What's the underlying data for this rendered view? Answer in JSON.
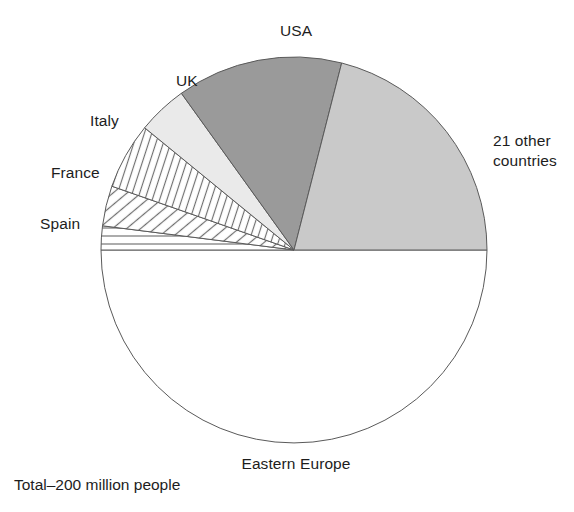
{
  "figure": {
    "caption": "Total–200 million people",
    "background": "#ffffff",
    "text_color": "#1d1d1d"
  },
  "chart_data": {
    "type": "pie",
    "title": "",
    "total_label": "Total–200 million people",
    "total_value": 200,
    "units": "million people",
    "legend": "none (direct slice labels)",
    "start_angle_deg": 180,
    "direction": "clockwise",
    "categories": [
      "Eastern Europe",
      "Spain",
      "France",
      "Italy",
      "UK",
      "USA",
      "21 other countries"
    ],
    "values": [
      100,
      4,
      6.7,
      11.1,
      8.3,
      27.8,
      42.1
    ],
    "percents": [
      50,
      2,
      3.35,
      5.55,
      4.15,
      13.9,
      21.05
    ],
    "angles_deg": [
      180,
      7.2,
      12.1,
      20.0,
      15.0,
      50.0,
      75.7
    ],
    "slices": [
      {
        "label": "Eastern Europe",
        "value": 100,
        "percent": 50,
        "angle_deg": 180,
        "fill": "#ffffff",
        "pattern": "solid",
        "label_position": "below"
      },
      {
        "label": "Spain",
        "value": 4,
        "percent": 2,
        "angle_deg": 7.2,
        "fill": "#ffffff",
        "pattern": "horizontal-lines",
        "label_position": "left"
      },
      {
        "label": "France",
        "value": 6.7,
        "percent": 3.35,
        "angle_deg": 12.1,
        "fill": "#ffffff",
        "pattern": "diagonal-lines-45",
        "label_position": "left"
      },
      {
        "label": "Italy",
        "value": 11.1,
        "percent": 5.55,
        "angle_deg": 20.0,
        "fill": "#ffffff",
        "pattern": "diagonal-lines-steep",
        "label_position": "left"
      },
      {
        "label": "UK",
        "value": 8.3,
        "percent": 4.15,
        "angle_deg": 15.0,
        "fill": "#eaeaea",
        "pattern": "solid",
        "label_position": "upper-left"
      },
      {
        "label": "USA",
        "value": 27.8,
        "percent": 13.9,
        "angle_deg": 50.0,
        "fill": "#9a9a9a",
        "pattern": "solid",
        "label_position": "top"
      },
      {
        "label": "21 other countries",
        "value": 42.1,
        "percent": 21.05,
        "angle_deg": 75.7,
        "fill": "#c9c9c9",
        "pattern": "solid",
        "label_position": "right"
      }
    ],
    "geometry": {
      "center_x": 294,
      "center_y": 250,
      "radius": 193
    }
  },
  "labels": {
    "usa": "USA",
    "uk": "UK",
    "italy": "Italy",
    "france": "France",
    "spain": "Spain",
    "other_line1": "21 other",
    "other_line2": "countries",
    "eastern_europe": "Eastern Europe"
  }
}
